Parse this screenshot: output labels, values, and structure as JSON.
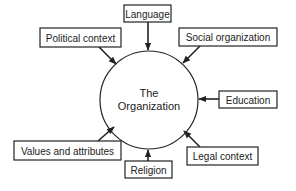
{
  "diagram": {
    "center": {
      "line1": "The",
      "line2": "Organization",
      "cx": 149,
      "cy": 100,
      "r": 49
    },
    "factors": [
      {
        "id": "language",
        "label": "Language",
        "box": [
          124,
          5,
          47,
          17
        ]
      },
      {
        "id": "political-context",
        "label": "Political context",
        "box": [
          40,
          28,
          81,
          19
        ]
      },
      {
        "id": "social-organization",
        "label": "Social organization",
        "box": [
          179,
          28,
          98,
          18
        ]
      },
      {
        "id": "education",
        "label": "Education",
        "box": [
          219,
          91,
          58,
          17
        ]
      },
      {
        "id": "values-and-attributes",
        "label": "Values and attributes",
        "box": [
          14,
          141,
          107,
          19
        ]
      },
      {
        "id": "religion",
        "label": "Religion",
        "box": [
          125,
          161,
          47,
          17
        ]
      },
      {
        "id": "legal-context",
        "label": "Legal context",
        "box": [
          187,
          147,
          71,
          18
        ]
      }
    ],
    "colors": {
      "stroke": "#222222",
      "background": "#ffffff"
    }
  }
}
